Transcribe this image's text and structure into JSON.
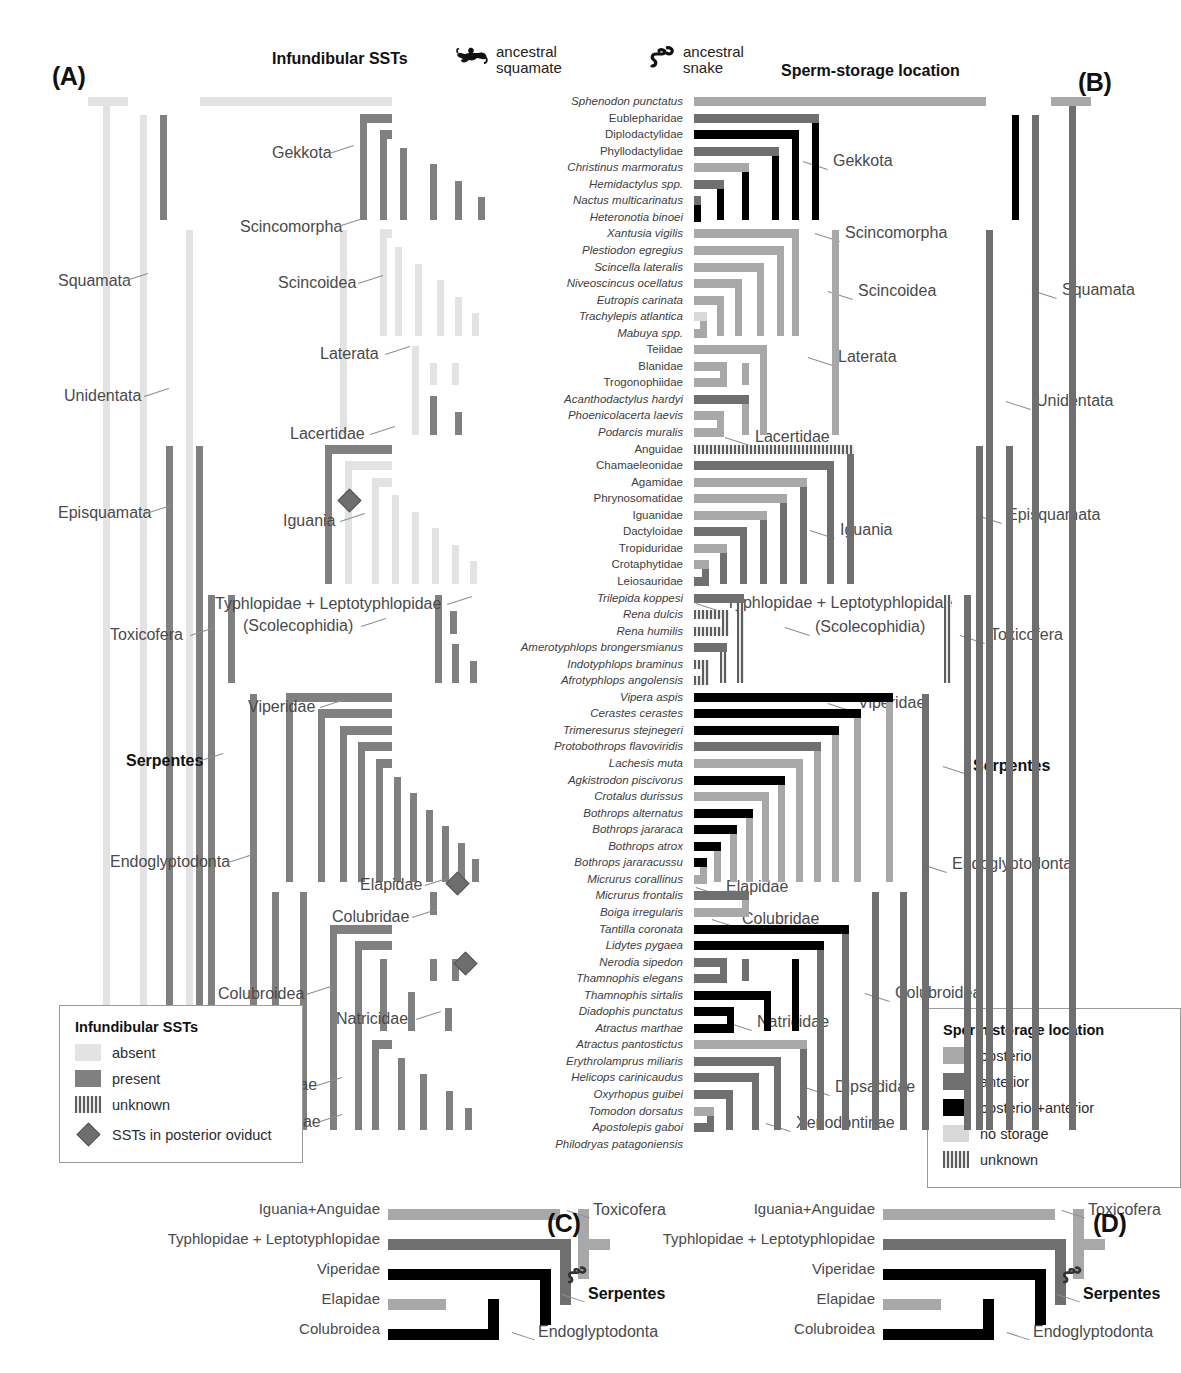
{
  "figure": {
    "panels": {
      "a": "(A)",
      "b": "(B)",
      "c": "(C)",
      "d": "(D)"
    },
    "column_headers": {
      "left": "Infundibular SSTs",
      "right": "Sperm-storage location"
    },
    "ancestral_annotations": [
      {
        "icon": "lizard-icon",
        "line1": "ancestral",
        "line2": "squamate"
      },
      {
        "icon": "snake-icon",
        "line1": "ancestral",
        "line2": "snake"
      }
    ]
  },
  "colors": {
    "absent": "#e3e3e3",
    "present": "#808080",
    "unknown": "#5d5d5d",
    "posterior": "#a8a8a8",
    "anterior": "#6f6f6f",
    "posterior_anterior": "#000000",
    "no_storage": "#d8d8d8",
    "diamond": "#6e6e6e",
    "leader": "#8d8d8d",
    "text": "#3d3d3d"
  },
  "taxa": [
    {
      "name": "Sphenodon punctatus",
      "italic": true,
      "sst": "absent",
      "storage": "posterior"
    },
    {
      "name": "Eublepharidae",
      "italic": false,
      "sst": "present",
      "storage": "anterior"
    },
    {
      "name": "Diplodactylidae",
      "italic": false,
      "sst": "present",
      "storage": "posterior+anterior"
    },
    {
      "name": "Phyllodactylidae",
      "italic": false,
      "sst": "present",
      "storage": "anterior"
    },
    {
      "name": "Christinus marmoratus",
      "italic": true,
      "sst": "unknown",
      "storage": "posterior"
    },
    {
      "name": "Hemidactylus spp.",
      "italic": true,
      "sst": "present",
      "storage": "anterior"
    },
    {
      "name": "Nactus multicarinatus",
      "italic": true,
      "sst": "present",
      "storage": "anterior"
    },
    {
      "name": "Heteronotia binoei",
      "italic": true,
      "sst": "present",
      "storage": "posterior+anterior"
    },
    {
      "name": "Xantusia vigilis",
      "italic": true,
      "sst": "absent",
      "storage": "posterior"
    },
    {
      "name": "Plestiodon egregius",
      "italic": true,
      "sst": "unknown",
      "storage": "posterior"
    },
    {
      "name": "Scincella lateralis",
      "italic": true,
      "sst": "absent",
      "storage": "posterior"
    },
    {
      "name": "Niveoscincus ocellatus",
      "italic": true,
      "sst": "absent",
      "storage": "posterior"
    },
    {
      "name": "Eutropis carinata",
      "italic": true,
      "sst": "unknown",
      "storage": "posterior"
    },
    {
      "name": "Trachylepis atlantica",
      "italic": true,
      "sst": "absent",
      "storage": "no storage"
    },
    {
      "name": "Mabuya spp.",
      "italic": true,
      "sst": "absent",
      "storage": "posterior"
    },
    {
      "name": "Teiidae",
      "italic": false,
      "sst": "absent",
      "storage": "posterior"
    },
    {
      "name": "Blanidae",
      "italic": false,
      "sst": "absent",
      "storage": "posterior"
    },
    {
      "name": "Trogonophiidae",
      "italic": false,
      "sst": "absent",
      "storage": "posterior"
    },
    {
      "name": "Acanthodactylus hardyi",
      "italic": true,
      "sst": "present",
      "storage": "anterior"
    },
    {
      "name": "Phoenicolacerta laevis",
      "italic": true,
      "sst": "unknown",
      "storage": "posterior"
    },
    {
      "name": "Podarcis muralis",
      "italic": true,
      "sst": "present",
      "storage": "posterior"
    },
    {
      "name": "Anguidae",
      "italic": false,
      "sst": "present",
      "storage": "unknown"
    },
    {
      "name": "Chamaeleonidae",
      "italic": false,
      "sst": "absent",
      "storage": "anterior"
    },
    {
      "name": "Agamidae",
      "italic": false,
      "sst": "absent",
      "storage": "posterior"
    },
    {
      "name": "Phrynosomatidae",
      "italic": false,
      "sst": "absent",
      "storage": "posterior"
    },
    {
      "name": "Iguanidae",
      "italic": false,
      "sst": "absent",
      "storage": "posterior"
    },
    {
      "name": "Dactyloidae",
      "italic": false,
      "sst": "absent",
      "storage": "anterior"
    },
    {
      "name": "Tropiduridae",
      "italic": false,
      "sst": "absent",
      "storage": "posterior"
    },
    {
      "name": "Crotaphytidae",
      "italic": false,
      "sst": "absent",
      "storage": "posterior"
    },
    {
      "name": "Leiosauridae",
      "italic": false,
      "sst": "absent",
      "storage": "anterior"
    },
    {
      "name": "Trilepida koppesi",
      "italic": true,
      "sst": "present",
      "storage": "anterior"
    },
    {
      "name": "Rena dulcis",
      "italic": true,
      "sst": "present",
      "storage": "unknown"
    },
    {
      "name": "Rena humilis",
      "italic": true,
      "sst": "present",
      "storage": "unknown"
    },
    {
      "name": "Amerotyphlops brongersmianus",
      "italic": true,
      "sst": "present",
      "storage": "anterior"
    },
    {
      "name": "Indotyphlops braminus",
      "italic": true,
      "sst": "present",
      "storage": "unknown"
    },
    {
      "name": "Afrotyphlops angolensis",
      "italic": true,
      "sst": "present",
      "storage": "unknown"
    },
    {
      "name": "Vipera aspis",
      "italic": true,
      "sst": "present",
      "storage": "posterior+anterior"
    },
    {
      "name": "Cerastes cerastes",
      "italic": true,
      "sst": "present",
      "storage": "posterior+anterior"
    },
    {
      "name": "Trimeresurus stejnegeri",
      "italic": true,
      "sst": "present",
      "storage": "posterior+anterior"
    },
    {
      "name": "Protobothrops flavoviridis",
      "italic": true,
      "sst": "present",
      "storage": "anterior"
    },
    {
      "name": "Lachesis muta",
      "italic": true,
      "sst": "present",
      "storage": "posterior"
    },
    {
      "name": "Agkistrodon piscivorus",
      "italic": true,
      "sst": "present",
      "storage": "posterior+anterior"
    },
    {
      "name": "Crotalus durissus",
      "italic": true,
      "sst": "present",
      "storage": "posterior"
    },
    {
      "name": "Bothrops alternatus",
      "italic": true,
      "sst": "present",
      "storage": "posterior+anterior"
    },
    {
      "name": "Bothrops jararaca",
      "italic": true,
      "sst": "present",
      "storage": "posterior+anterior"
    },
    {
      "name": "Bothrops atrox",
      "italic": true,
      "sst": "present",
      "storage": "posterior+anterior"
    },
    {
      "name": "Bothrops jararacussu",
      "italic": true,
      "sst": "present",
      "storage": "posterior+anterior"
    },
    {
      "name": "Micrurus corallinus",
      "italic": true,
      "sst": "present",
      "storage": "posterior"
    },
    {
      "name": "Micrurus frontalis",
      "italic": true,
      "sst": "present",
      "storage": "anterior"
    },
    {
      "name": "Boiga irregularis",
      "italic": true,
      "sst": "absent",
      "storage": "posterior"
    },
    {
      "name": "Tantilla coronata",
      "italic": true,
      "sst": "present",
      "storage": "posterior+anterior"
    },
    {
      "name": "Lidytes pygaea",
      "italic": true,
      "sst": "present",
      "storage": "posterior+anterior"
    },
    {
      "name": "Nerodia sipedon",
      "italic": true,
      "sst": "present",
      "storage": "anterior"
    },
    {
      "name": "Thamnophis elegans",
      "italic": true,
      "sst": "present",
      "storage": "anterior"
    },
    {
      "name": "Thamnophis sirtalis",
      "italic": true,
      "sst": "present",
      "storage": "posterior+anterior"
    },
    {
      "name": "Diadophis punctatus",
      "italic": true,
      "sst": "present",
      "storage": "posterior+anterior"
    },
    {
      "name": "Atractus marthae",
      "italic": true,
      "sst": "present",
      "storage": "posterior+anterior"
    },
    {
      "name": "Atractus pantostictus",
      "italic": true,
      "sst": "present",
      "storage": "posterior"
    },
    {
      "name": "Erythrolamprus miliaris",
      "italic": true,
      "sst": "present",
      "storage": "anterior"
    },
    {
      "name": "Helicops carinicaudus",
      "italic": true,
      "sst": "present",
      "storage": "anterior"
    },
    {
      "name": "Oxyrhopus guibei",
      "italic": true,
      "sst": "present",
      "storage": "anterior"
    },
    {
      "name": "Tomodon dorsatus",
      "italic": true,
      "sst": "present",
      "storage": "posterior"
    },
    {
      "name": "Apostolepis gaboi",
      "italic": true,
      "sst": "present",
      "storage": "anterior"
    },
    {
      "name": "Philodryas patagoniensis",
      "italic": true,
      "sst": "present",
      "storage": "posterior+anterior"
    }
  ],
  "clade_labels_left": [
    {
      "text": "Gekkota",
      "x": 272,
      "y": 144
    },
    {
      "text": "Squamata",
      "x": 58,
      "y": 272
    },
    {
      "text": "Scincomorpha",
      "x": 240,
      "y": 218
    },
    {
      "text": "Scincoidea",
      "x": 278,
      "y": 274
    },
    {
      "text": "Unidentata",
      "x": 64,
      "y": 387
    },
    {
      "text": "Laterata",
      "x": 320,
      "y": 345
    },
    {
      "text": "Lacertidae",
      "x": 290,
      "y": 425
    },
    {
      "text": "Episquamata",
      "x": 58,
      "y": 504
    },
    {
      "text": "Iguania",
      "x": 283,
      "y": 512
    },
    {
      "text": "Typhlopidae + Leptotyphlopidae",
      "x": 215,
      "y": 595
    },
    {
      "text": "(Scolecophidia)",
      "x": 243,
      "y": 617
    },
    {
      "text": "Toxicofera",
      "x": 110,
      "y": 626
    },
    {
      "text": "Viperidae",
      "x": 248,
      "y": 698
    },
    {
      "text": "Serpentes",
      "x": 126,
      "y": 752,
      "bold": true
    },
    {
      "text": "Endoglyptodonta",
      "x": 110,
      "y": 853
    },
    {
      "text": "Elapidae",
      "x": 360,
      "y": 876
    },
    {
      "text": "Colubridae",
      "x": 332,
      "y": 908
    },
    {
      "text": "Colubroidea",
      "x": 218,
      "y": 985
    },
    {
      "text": "Natricidae",
      "x": 336,
      "y": 1010
    },
    {
      "text": "Dipsadidae",
      "x": 237,
      "y": 1076
    },
    {
      "text": "Xenodontinae",
      "x": 222,
      "y": 1113
    }
  ],
  "clade_labels_right": [
    {
      "text": "Gekkota",
      "x": 833,
      "y": 152
    },
    {
      "text": "Squamata",
      "x": 1062,
      "y": 281
    },
    {
      "text": "Scincomorpha",
      "x": 845,
      "y": 224
    },
    {
      "text": "Scincoidea",
      "x": 858,
      "y": 282
    },
    {
      "text": "Unidentata",
      "x": 1036,
      "y": 392
    },
    {
      "text": "Laterata",
      "x": 838,
      "y": 348
    },
    {
      "text": "Lacertidae",
      "x": 755,
      "y": 428
    },
    {
      "text": "Episquamata",
      "x": 1007,
      "y": 506
    },
    {
      "text": "Iguania",
      "x": 840,
      "y": 521
    },
    {
      "text": "Typhlopidae + Leptotyphlopidae",
      "x": 726,
      "y": 594
    },
    {
      "text": "(Scolecophidia)",
      "x": 815,
      "y": 618
    },
    {
      "text": "Toxicofera",
      "x": 990,
      "y": 626
    },
    {
      "text": "Viperidae",
      "x": 858,
      "y": 694
    },
    {
      "text": "Serpentes",
      "x": 973,
      "y": 757,
      "bold": true
    },
    {
      "text": "Endoglyptodonta",
      "x": 952,
      "y": 855
    },
    {
      "text": "Elapidae",
      "x": 726,
      "y": 878
    },
    {
      "text": "Colubridae",
      "x": 742,
      "y": 910
    },
    {
      "text": "Colubroidea",
      "x": 895,
      "y": 984
    },
    {
      "text": "Natricidae",
      "x": 757,
      "y": 1013
    },
    {
      "text": "Dipsadidae",
      "x": 835,
      "y": 1078
    },
    {
      "text": "Xenodontinae",
      "x": 796,
      "y": 1114
    }
  ],
  "legend_left": {
    "title": "Infundibular SSTs",
    "items": [
      {
        "label": "absent",
        "key": "absent"
      },
      {
        "label": "present",
        "key": "present"
      },
      {
        "label": "unknown",
        "key": "unknown"
      }
    ],
    "marker": {
      "label": "SSTs in posterior oviduct",
      "key": "diamond"
    }
  },
  "legend_right": {
    "title": "Sperm storage location",
    "items": [
      {
        "label": "posterior",
        "key": "posterior"
      },
      {
        "label": "anterior",
        "key": "anterior"
      },
      {
        "label": "posterior+anterior",
        "key": "posterior+anterior"
      },
      {
        "label": "no storage",
        "key": "no storage"
      },
      {
        "label": "unknown",
        "key": "unknown"
      }
    ]
  },
  "mini_trees": {
    "tips": [
      "Iguania+Anguidae",
      "Typhlopidae + Leptotyphlopidae",
      "Viperidae",
      "Elapidae",
      "Colubroidea"
    ],
    "nodes": [
      "Toxicofera",
      "Serpentes",
      "Endoglyptodonta"
    ],
    "c_states": [
      "posterior",
      "anterior",
      "posterior+anterior",
      "posterior",
      "posterior+anterior"
    ],
    "d_states": [
      "posterior",
      "anterior",
      "posterior+anterior",
      "posterior",
      "posterior+anterior"
    ]
  }
}
